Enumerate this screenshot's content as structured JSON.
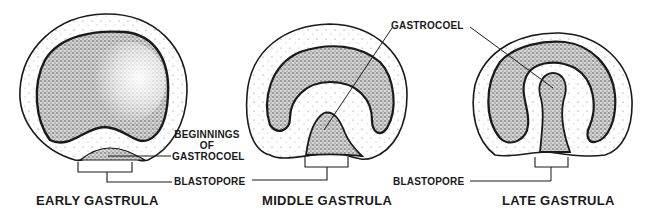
{
  "diagram": {
    "stages": [
      {
        "id": "early",
        "caption": "EARLY GASTRULA"
      },
      {
        "id": "middle",
        "caption": "MIDDLE GASTRULA"
      },
      {
        "id": "late",
        "caption": "LATE GASTRULA"
      }
    ],
    "labels": {
      "beginnings_line1": "BEGINNINGS",
      "beginnings_line2": "OF",
      "beginnings_line3": "GASTROCOEL",
      "blastopore_1": "BLASTOPORE",
      "blastopore_2": "BLASTOPORE",
      "gastrocoel": "GASTROCOEL"
    },
    "colors": {
      "ink": "#1a1a1a",
      "background": "#ffffff",
      "stipple_dense": "#555555",
      "stipple_light": "#bbbbbb"
    }
  }
}
